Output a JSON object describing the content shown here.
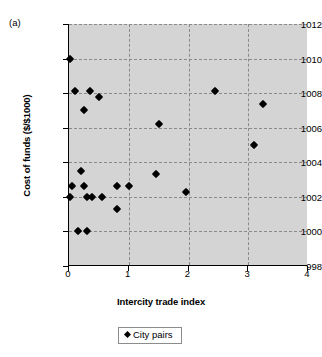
{
  "figure": {
    "panel_label": "(a)",
    "title_remnant": "",
    "background_color": "#d4d4d4",
    "marker_color": "#000000",
    "grid_color": "#8a8a8a"
  },
  "legend": {
    "position": "bottom-center",
    "marker_icon": "diamond-marker-icon",
    "entries": [
      {
        "label": "City pairs",
        "marker": "diamond",
        "color": "#000000"
      }
    ]
  },
  "chart_data": {
    "type": "scatter",
    "title": "",
    "subtitle": "",
    "panel": "(a)",
    "xlabel": "Intercity trade index",
    "ylabel": "Cost of funds ($/$1000)",
    "xlim": [
      0,
      4
    ],
    "ylim": [
      998,
      1012
    ],
    "xticks": [
      0,
      1,
      2,
      3,
      4
    ],
    "yticks": [
      998,
      1000,
      1002,
      1004,
      1006,
      1008,
      1010,
      1012
    ],
    "xtick_labels": [
      "0",
      "1",
      "2",
      "3",
      "4"
    ],
    "ytick_labels": [
      "998",
      "1000",
      "1002",
      "1004",
      "1006",
      "1008",
      "1010",
      "1012"
    ],
    "grid": true,
    "grid_style": "dashed",
    "legend_position": "below-axes",
    "series": [
      {
        "name": "City pairs",
        "marker": "diamond",
        "color": "#000000",
        "points": [
          {
            "x": 0.02,
            "y": 1010.0
          },
          {
            "x": 0.1,
            "y": 1008.1
          },
          {
            "x": 0.35,
            "y": 1008.1
          },
          {
            "x": 0.5,
            "y": 1007.8
          },
          {
            "x": 0.25,
            "y": 1007.0
          },
          {
            "x": 1.5,
            "y": 1006.2
          },
          {
            "x": 2.45,
            "y": 1008.1
          },
          {
            "x": 3.25,
            "y": 1007.4
          },
          {
            "x": 3.1,
            "y": 1005.0
          },
          {
            "x": 0.2,
            "y": 1003.5
          },
          {
            "x": 1.45,
            "y": 1003.3
          },
          {
            "x": 0.05,
            "y": 1002.6
          },
          {
            "x": 0.25,
            "y": 1002.6
          },
          {
            "x": 0.8,
            "y": 1002.6
          },
          {
            "x": 1.0,
            "y": 1002.6
          },
          {
            "x": 1.95,
            "y": 1002.3
          },
          {
            "x": 0.02,
            "y": 1002.0
          },
          {
            "x": 0.3,
            "y": 1002.0
          },
          {
            "x": 0.38,
            "y": 1002.0
          },
          {
            "x": 0.55,
            "y": 1002.0
          },
          {
            "x": 0.8,
            "y": 1001.3
          },
          {
            "x": 0.15,
            "y": 1000.0
          },
          {
            "x": 0.3,
            "y": 1000.0
          }
        ]
      }
    ]
  }
}
